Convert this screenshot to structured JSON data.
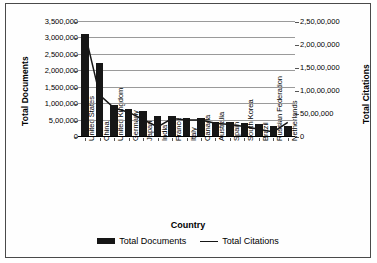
{
  "chart_data": {
    "type": "bar",
    "title": "",
    "xlabel": "Country",
    "ylabel": "Total Documents",
    "y2label": "Total Citations",
    "grid": true,
    "legend_position": "bottom",
    "categories": [
      "United States",
      "China",
      "United Kingdom",
      "Germany",
      "Japan",
      "India",
      "France",
      "Italy",
      "Canada",
      "Australia",
      "Spain",
      "South Korea",
      "Brazil",
      "Russian Federation",
      "Netherlands"
    ],
    "ylim": [
      0,
      3500000
    ],
    "yticks": [
      0,
      500000,
      1000000,
      1500000,
      2000000,
      2500000,
      3000000,
      3500000
    ],
    "ytick_labels": [
      "0",
      "5,00,000",
      "1,000,000",
      "1,500,000",
      "2,000,000",
      "2,500,000",
      "3,000,000",
      "3,500,000"
    ],
    "y2lim": [
      0,
      25000000
    ],
    "y2ticks": [
      0,
      5000000,
      10000000,
      15000000,
      20000000,
      25000000
    ],
    "y2tick_labels": [
      "0",
      "50,00,000",
      "1,00,00,000",
      "1,50,00,000",
      "2,00,00,000",
      "2,50,00,000"
    ],
    "series": [
      {
        "name": "Total Documents",
        "type": "bar",
        "axis": "left",
        "color": "#161616",
        "values": [
          3120000,
          2220000,
          930000,
          820000,
          760000,
          620000,
          610000,
          560000,
          550000,
          430000,
          420000,
          400000,
          360000,
          300000,
          290000
        ]
      },
      {
        "name": "Total Citations",
        "type": "line",
        "axis": "right",
        "color": "#161616",
        "values": [
          22300000,
          9100000,
          6300000,
          5400000,
          3800000,
          2200000,
          4000000,
          3700000,
          3700000,
          3000000,
          2700000,
          2300000,
          1700000,
          1100000,
          3200000
        ]
      }
    ]
  },
  "legend": [
    {
      "label": "Total Documents",
      "marker": "bar"
    },
    {
      "label": "Total Citations",
      "marker": "line"
    }
  ]
}
